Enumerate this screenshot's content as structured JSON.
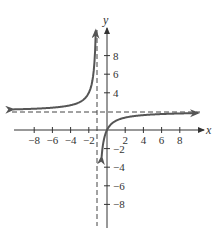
{
  "chart_data": {
    "type": "line",
    "title": "",
    "xlabel": "x",
    "ylabel": "y",
    "xlim": [
      -10,
      10
    ],
    "ylim": [
      -10,
      10
    ],
    "grid": false,
    "x_ticks": [
      -8,
      -6,
      -4,
      -2,
      2,
      4,
      6,
      8
    ],
    "y_ticks": [
      8,
      6,
      4,
      -2,
      -4,
      -6,
      -8
    ],
    "x_tick_labels": [
      "−8",
      "−6",
      "−4",
      "−2",
      "2",
      "4",
      "6",
      "8"
    ],
    "y_tick_labels": [
      "8",
      "6",
      "4",
      "−2",
      "−4",
      "−6",
      "−8"
    ],
    "asymptotes": {
      "vertical": {
        "x": -1,
        "style": "dashed"
      },
      "horizontal": {
        "y": 2,
        "style": "dashed"
      }
    },
    "series": [
      {
        "name": "f(x) = 2x/(x+1)",
        "branches": [
          {
            "name": "left-branch",
            "x": [
              -10,
              -6,
              -4,
              -3,
              -2,
              -1.5,
              -1.25
            ],
            "y": [
              2.22,
              2.4,
              2.67,
              3,
              4,
              6,
              10
            ]
          },
          {
            "name": "right-branch",
            "x": [
              -0.55,
              -0.5,
              0,
              1,
              2,
              4,
              6,
              10
            ],
            "y": [
              -2.44,
              -2,
              0,
              1,
              1.33,
              1.6,
              1.71,
              1.82
            ]
          }
        ]
      }
    ],
    "colors": {
      "curve": "#555555",
      "axis": "#333333",
      "asymptote": "#444444"
    }
  }
}
